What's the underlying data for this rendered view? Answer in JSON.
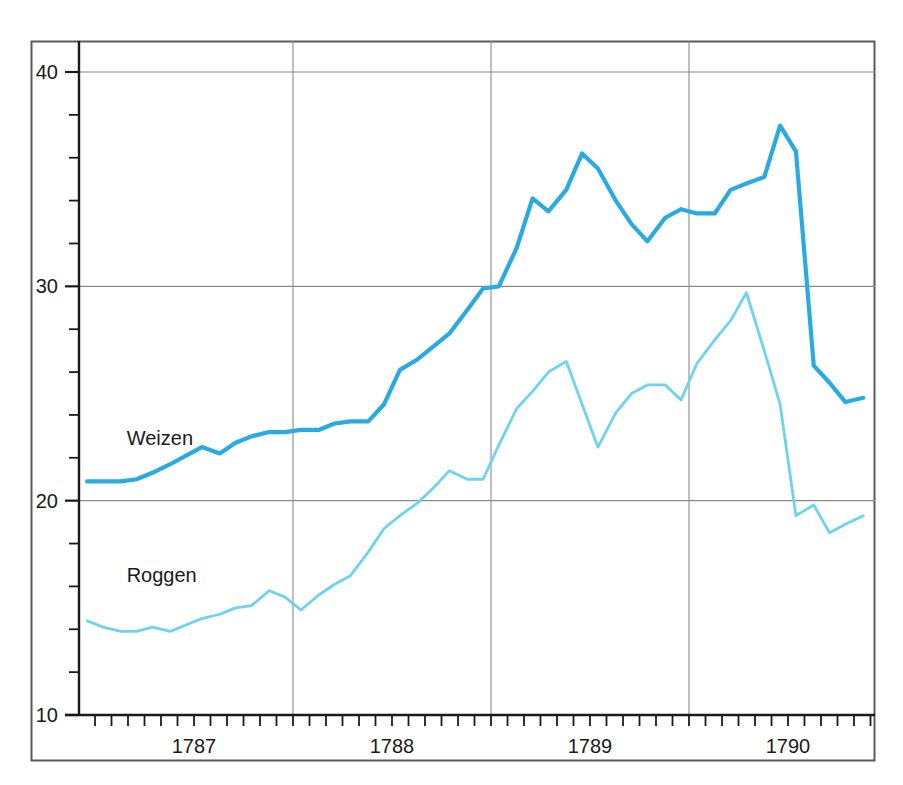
{
  "chart_data": {
    "type": "line",
    "title": "",
    "subtitle": "",
    "xlabel": "",
    "ylabel": "",
    "xlim": [
      1786.46,
      1790.42
    ],
    "ylim": [
      10,
      41.5
    ],
    "grid": true,
    "grid_x_values": [
      1787.5,
      1788.5,
      1789.5
    ],
    "grid_y_values": [
      20,
      30,
      40
    ],
    "legend_position": "inline-labels",
    "x_tick_labels": [
      "1787",
      "1788",
      "1789",
      "1790"
    ],
    "x_tick_label_values": [
      1787,
      1788,
      1789,
      1790
    ],
    "x_minor_tick_step": 0.0833,
    "y_tick_labels": [
      "10",
      "20",
      "30",
      "40"
    ],
    "y_tick_label_values": [
      10,
      20,
      30,
      40
    ],
    "y_minor_tick_step": 2,
    "series": [
      {
        "name": "Weizen",
        "color": "#29ABE2",
        "line_width": 4.2,
        "label_x": 1786.66,
        "label_y": 22.6,
        "x": [
          1786.46,
          1786.54,
          1786.63,
          1786.71,
          1786.79,
          1786.88,
          1786.96,
          1787.04,
          1787.13,
          1787.21,
          1787.29,
          1787.38,
          1787.46,
          1787.54,
          1787.63,
          1787.71,
          1787.79,
          1787.88,
          1787.96,
          1788.04,
          1788.13,
          1788.21,
          1788.29,
          1788.38,
          1788.46,
          1788.54,
          1788.63,
          1788.71,
          1788.79,
          1788.88,
          1788.96,
          1789.04,
          1789.13,
          1789.21,
          1789.29,
          1789.38,
          1789.46,
          1789.54,
          1789.63,
          1789.71,
          1789.79,
          1789.88,
          1789.96,
          1790.04,
          1790.13,
          1790.21,
          1790.29,
          1790.38
        ],
        "values": [
          20.9,
          20.9,
          20.9,
          21.0,
          21.3,
          21.7,
          22.1,
          22.5,
          22.2,
          22.7,
          23.0,
          23.2,
          23.2,
          23.3,
          23.3,
          23.6,
          23.7,
          23.7,
          24.5,
          26.1,
          26.6,
          27.2,
          27.8,
          28.9,
          29.9,
          30.0,
          31.8,
          34.1,
          33.5,
          34.5,
          36.2,
          35.5,
          34.0,
          32.9,
          32.1,
          33.2,
          33.6,
          33.4,
          33.4,
          34.5,
          34.8,
          35.1,
          37.5,
          36.3,
          26.3,
          25.5,
          24.6,
          24.8
        ],
        "notes": "Wheat price index, darker cyan, thicker line"
      },
      {
        "name": "Roggen",
        "color": "#6DD4F0",
        "line_width": 2.8,
        "label_x": 1786.66,
        "label_y": 16.2,
        "x": [
          1786.46,
          1786.54,
          1786.63,
          1786.71,
          1786.79,
          1786.88,
          1786.96,
          1787.04,
          1787.13,
          1787.21,
          1787.29,
          1787.38,
          1787.46,
          1787.54,
          1787.63,
          1787.71,
          1787.79,
          1787.88,
          1787.96,
          1788.04,
          1788.13,
          1788.21,
          1788.29,
          1788.38,
          1788.46,
          1788.54,
          1788.63,
          1788.71,
          1788.79,
          1788.88,
          1788.96,
          1789.04,
          1789.13,
          1789.21,
          1789.29,
          1789.38,
          1789.46,
          1789.54,
          1789.63,
          1789.71,
          1789.79,
          1789.88,
          1789.96,
          1790.04,
          1790.13,
          1790.21,
          1790.29,
          1790.38
        ],
        "values": [
          14.4,
          14.1,
          13.9,
          13.9,
          14.1,
          13.9,
          14.2,
          14.5,
          14.7,
          15.0,
          15.1,
          15.8,
          15.5,
          14.9,
          15.6,
          16.1,
          16.5,
          17.6,
          18.7,
          19.3,
          19.9,
          20.6,
          21.4,
          21.0,
          21.0,
          22.6,
          24.3,
          25.1,
          26.0,
          26.5,
          24.5,
          22.5,
          24.1,
          25.0,
          25.4,
          25.4,
          24.7,
          26.4,
          27.5,
          28.4,
          29.7,
          27.0,
          24.5,
          19.3,
          19.8,
          18.5,
          18.9,
          19.3
        ],
        "notes": "Rye price index, lighter cyan, thinner line"
      }
    ]
  },
  "frame": {
    "outer_border_color": "#5a5a5a",
    "axis_color": "#1a1a1a",
    "grid_color": "#8a8a8a",
    "background": "#ffffff"
  }
}
